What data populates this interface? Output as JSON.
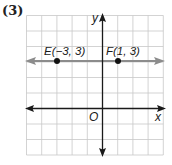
{
  "problem_number": "(3)",
  "graph": {
    "type": "coordinate-plane",
    "x_axis_label": "x",
    "y_axis_label": "y",
    "origin_label": "O",
    "x_range": [
      -5,
      4
    ],
    "y_range": [
      -3,
      6
    ],
    "grid": true,
    "points": [
      {
        "name": "E",
        "label": "E(−3, 3)",
        "x": -3,
        "y": 3
      },
      {
        "name": "F",
        "label": "F(1, 3)",
        "x": 1,
        "y": 3
      }
    ],
    "line": {
      "through": [
        "E",
        "F"
      ],
      "equation": "y = 3",
      "color": "#8c8c8c"
    },
    "colors": {
      "grid": "#c8c8c8",
      "axes": "#1a1a1a",
      "points": "#111111",
      "line": "#8c8c8c"
    }
  }
}
